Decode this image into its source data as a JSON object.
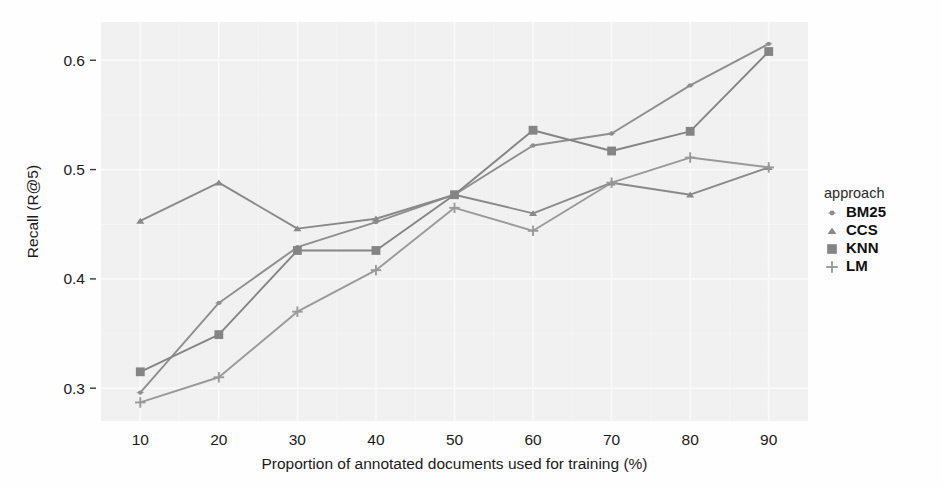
{
  "chart_data": {
    "type": "line",
    "title": "",
    "xlabel": "Proportion of annotated documents used for training (%)",
    "ylabel": "Recall (R@5)",
    "x": [
      10,
      20,
      30,
      40,
      50,
      60,
      70,
      80,
      90
    ],
    "xticks": [
      "10",
      "20",
      "30",
      "40",
      "50",
      "60",
      "70",
      "80",
      "90"
    ],
    "yticks": [
      "0.3",
      "0.4",
      "0.5",
      "0.6"
    ],
    "ytick_values": [
      0.3,
      0.4,
      0.5,
      0.6
    ],
    "xlim": [
      5,
      95
    ],
    "ylim": [
      0.27,
      0.635
    ],
    "grid": true,
    "legend_title": "approach",
    "legend_position": "right",
    "series": [
      {
        "name": "BM25",
        "marker": "circle",
        "color": "#8f8f8f",
        "values": [
          0.296,
          0.378,
          0.429,
          0.452,
          0.477,
          0.522,
          0.533,
          0.577,
          0.615
        ]
      },
      {
        "name": "CCS",
        "marker": "triangle",
        "color": "#8a8a8a",
        "values": [
          0.453,
          0.488,
          0.446,
          0.455,
          0.477,
          0.46,
          0.488,
          0.477,
          0.502
        ]
      },
      {
        "name": "KNN",
        "marker": "square",
        "color": "#858585",
        "values": [
          0.315,
          0.349,
          0.426,
          0.426,
          0.477,
          0.536,
          0.517,
          0.535,
          0.608
        ]
      },
      {
        "name": "LM",
        "marker": "plus",
        "color": "#9a9a9a",
        "values": [
          0.287,
          0.31,
          0.37,
          0.408,
          0.465,
          0.444,
          0.488,
          0.511,
          0.502
        ]
      }
    ]
  },
  "style": {
    "panel_bg": "#f2f2f2",
    "grid_major": "#fbfbfb",
    "page_bg": "#ffffff",
    "text_color": "#1b1b1b"
  }
}
